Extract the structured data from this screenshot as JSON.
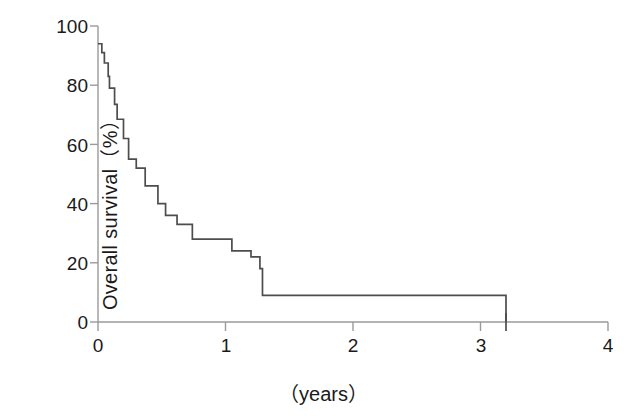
{
  "figure": {
    "background_color": "#ffffff",
    "line_color": "#4d4d4d",
    "axis_color": "#9a9a9a",
    "text_color": "#1a1a1a"
  },
  "axes": {
    "y_title": "Overall survival（%）",
    "x_title": "（years）",
    "y_ticks": [
      "0",
      "20",
      "40",
      "60",
      "80",
      "100"
    ],
    "x_ticks": [
      "0",
      "1",
      "2",
      "3",
      "4"
    ]
  },
  "chart_data": {
    "type": "line",
    "subtype": "kaplan-meier-step",
    "title": "",
    "xlabel": "（years）",
    "ylabel": "Overall survival（%）",
    "xlim": [
      0,
      4
    ],
    "ylim": [
      0,
      100
    ],
    "xticks": [
      0,
      1,
      2,
      3,
      4
    ],
    "yticks": [
      0,
      20,
      40,
      60,
      80,
      100
    ],
    "grid": false,
    "legend": "none",
    "series": [
      {
        "name": "Overall survival",
        "step": "post",
        "x": [
          0.0,
          0.02,
          0.03,
          0.05,
          0.06,
          0.08,
          0.09,
          0.11,
          0.13,
          0.15,
          0.17,
          0.2,
          0.24,
          0.3,
          0.37,
          0.44,
          0.47,
          0.53,
          0.62,
          0.74,
          0.92,
          1.05,
          1.2,
          1.27,
          1.29,
          1.78,
          3.2,
          3.2
        ],
        "y": [
          94.0,
          94.0,
          91.0,
          87.5,
          87.5,
          83.0,
          79.0,
          79.0,
          73.5,
          68.5,
          68.5,
          62.0,
          55.0,
          52.0,
          46.0,
          46.0,
          40.0,
          36.0,
          33.0,
          28.0,
          28.0,
          24.0,
          22.0,
          18.0,
          9.0,
          9.0,
          4.5,
          0.0
        ]
      }
    ],
    "annotations": []
  }
}
